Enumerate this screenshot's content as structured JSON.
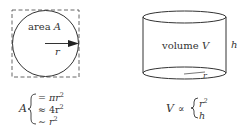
{
  "circle_figure": {
    "area_label_prefix": "area ",
    "area_label_var": "A",
    "radius_label": "r"
  },
  "cylinder_figure": {
    "volume_label_prefix": "volume ",
    "volume_label_var": "V",
    "height_label": "h",
    "radius_label": "r"
  },
  "area_equations": {
    "lhs": "A",
    "lines": [
      {
        "op": "=",
        "expr": "πr",
        "exp": "2"
      },
      {
        "op": "≈",
        "expr": "4r",
        "exp": "2"
      },
      {
        "op": "∼",
        "expr": "r",
        "exp": "2"
      }
    ]
  },
  "volume_equations": {
    "lhs": "V",
    "relation": "∝",
    "lines": [
      {
        "expr": "r",
        "exp": "2"
      },
      {
        "expr": "h",
        "exp": ""
      }
    ]
  },
  "colors": {
    "stroke": "#333333",
    "background": "#ffffff"
  }
}
